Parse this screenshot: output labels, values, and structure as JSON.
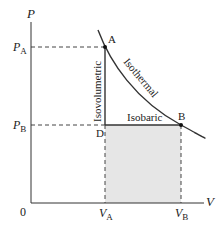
{
  "diagram": {
    "type": "PV diagram",
    "axes": {
      "y_label": "P",
      "x_label": "V",
      "origin_label": "0"
    },
    "ticks": {
      "pa": {
        "main": "P",
        "sub": "A"
      },
      "pb": {
        "main": "P",
        "sub": "B"
      },
      "va": {
        "main": "V",
        "sub": "A"
      },
      "vb": {
        "main": "V",
        "sub": "B"
      }
    },
    "points": {
      "a": "A",
      "b": "B",
      "d": "D"
    },
    "processes": {
      "isothermal": "Isothermal",
      "isovolumetric": "Isovolumetric",
      "isobaric": "Isobaric"
    },
    "colors": {
      "line": "#333333",
      "shade": "#e6e6e6",
      "dash": "#444444"
    }
  }
}
